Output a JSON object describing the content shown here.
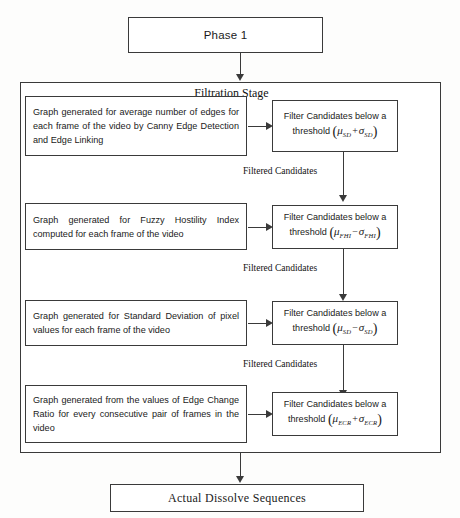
{
  "diagram": {
    "phase": {
      "label": "Phase 1"
    },
    "stage": {
      "title": "Filtration Stage"
    },
    "rows": [
      {
        "description": "Graph generated for average number of edges for each frame of the video by Canny Edge Detection and Edge Linking",
        "filter_line1": "Filter Candidates below a",
        "filter_line2_prefix": "threshold",
        "mu_subscript": "SD",
        "operator": "+",
        "sigma_subscript": "SD",
        "edge_label": "Filtered Candidates"
      },
      {
        "description": "Graph generated for Fuzzy Hostility Index computed for each frame of the video",
        "filter_line1": "Filter Candidates below a",
        "filter_line2_prefix": "threshold",
        "mu_subscript": "FHI",
        "operator": "−",
        "sigma_subscript": "FHI",
        "edge_label": "Filtered Candidates"
      },
      {
        "description": "Graph generated for Standard Deviation of pixel values for each frame of the video",
        "filter_line1": "Filter Candidates below a",
        "filter_line2_prefix": "threshold",
        "mu_subscript": "SD",
        "operator": "−",
        "sigma_subscript": "SD",
        "edge_label": "Filtered Candidates"
      },
      {
        "description": "Graph generated from the values of Edge Change Ratio for every consecutive pair of frames in the video",
        "filter_line1": "Filter Candidates below a",
        "filter_line2_prefix": "threshold",
        "mu_subscript": "ECR",
        "operator": "+",
        "sigma_subscript": "ECR",
        "edge_label": ""
      }
    ],
    "final": {
      "label": "Actual Dissolve Sequences"
    },
    "symbols": {
      "mu": "μ",
      "sigma": "σ",
      "paren_open": "(",
      "paren_close": ")"
    },
    "colors": {
      "stroke": "#3a3a3a",
      "background": "#fdfdfc",
      "text": "#1a1a1a"
    }
  }
}
